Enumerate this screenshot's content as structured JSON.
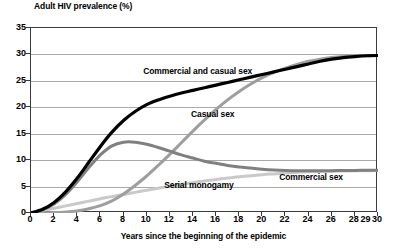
{
  "chart_data": {
    "type": "line",
    "title": "Adult HIV prevalence (%)",
    "xlabel": "Years since the beginning of the epidemic",
    "ylabel": "Adult HIV prevalence (%)",
    "xlim": [
      0,
      30
    ],
    "ylim": [
      0,
      35
    ],
    "grid": true,
    "legend_position": "inline-annotations",
    "x_tick_labels": [
      "0",
      "2",
      "4",
      "6",
      "8",
      "10",
      "12",
      "14",
      "16",
      "18",
      "20",
      "22",
      "24",
      "26",
      "28",
      "29",
      "30"
    ],
    "x_tick_values": [
      0,
      2,
      4,
      6,
      8,
      10,
      12,
      14,
      16,
      18,
      20,
      22,
      24,
      26,
      28,
      29,
      30
    ],
    "y_tick_labels": [
      "0",
      "5",
      "10",
      "15",
      "20",
      "25",
      "30",
      "35"
    ],
    "y_tick_values": [
      0,
      5,
      10,
      15,
      20,
      25,
      30,
      35
    ],
    "x": [
      0,
      1,
      2,
      3,
      4,
      5,
      6,
      7,
      8,
      9,
      10,
      11,
      12,
      13,
      14,
      15,
      16,
      17,
      18,
      19,
      20,
      21,
      22,
      23,
      24,
      25,
      26,
      27,
      28,
      29,
      30
    ],
    "series": [
      {
        "name": "Commercial and casual sex",
        "color": "#000000",
        "width": 3.2,
        "label_x": 14.5,
        "label_y": 26.6,
        "values": [
          0,
          0.7,
          2.0,
          4.0,
          6.6,
          9.6,
          12.6,
          15.3,
          17.5,
          19.2,
          20.5,
          21.4,
          22.1,
          22.7,
          23.2,
          23.7,
          24.2,
          24.7,
          25.2,
          25.7,
          26.2,
          26.7,
          27.2,
          27.7,
          28.2,
          28.7,
          29.1,
          29.4,
          29.6,
          29.75,
          29.8
        ]
      },
      {
        "name": "Casual sex",
        "color": "#9e9e9e",
        "width": 3.0,
        "label_x": 15.8,
        "label_y": 18.6,
        "values": [
          0,
          0.05,
          0.1,
          0.2,
          0.4,
          0.8,
          1.4,
          2.3,
          3.6,
          5.2,
          7.0,
          9.0,
          11.1,
          13.3,
          15.5,
          17.6,
          19.6,
          21.4,
          23.0,
          24.4,
          25.6,
          26.6,
          27.4,
          28.1,
          28.7,
          29.1,
          29.4,
          29.6,
          29.7,
          29.75,
          29.8
        ]
      },
      {
        "name": "Commercial sex",
        "color": "#808080",
        "width": 3.0,
        "label_x": 24.3,
        "label_y": 6.6,
        "values": [
          0,
          0.6,
          1.7,
          3.5,
          5.9,
          8.6,
          11.0,
          12.7,
          13.4,
          13.4,
          13.0,
          12.4,
          11.7,
          11.0,
          10.4,
          9.8,
          9.4,
          9.0,
          8.7,
          8.5,
          8.3,
          8.15,
          8.05,
          8.0,
          8.0,
          8.0,
          8.0,
          8.05,
          8.05,
          8.1,
          8.1
        ]
      },
      {
        "name": "Serial monogamy",
        "color": "#c9c9c9",
        "width": 3.0,
        "label_x": 14.6,
        "label_y": 5.2,
        "values": [
          0,
          0.45,
          0.9,
          1.35,
          1.8,
          2.25,
          2.7,
          3.1,
          3.5,
          3.9,
          4.3,
          4.7,
          5.05,
          5.4,
          5.75,
          6.05,
          6.35,
          6.6,
          6.85,
          7.05,
          7.25,
          7.4,
          7.55,
          7.7,
          7.8,
          7.85,
          7.9,
          7.95,
          8.0,
          8.0,
          8.05
        ]
      }
    ]
  }
}
